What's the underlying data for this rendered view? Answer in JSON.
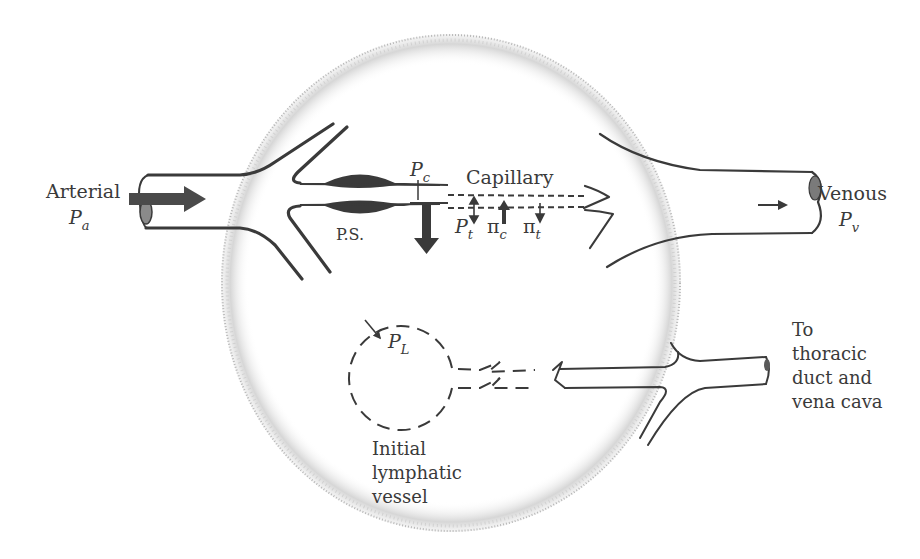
{
  "diagram": {
    "colors": {
      "ink": "#3a3a3a",
      "stipple": "#9a9a9a",
      "background": "#ffffff"
    },
    "labels": {
      "arterial": {
        "text": "Arterial",
        "symbol": "P",
        "subscript": "a"
      },
      "venous": {
        "text": "Venous",
        "symbol": "P",
        "subscript": "v"
      },
      "capillary": "Capillary",
      "precapillary_sphincter": "P.S.",
      "capillary_pressure": {
        "symbol": "P",
        "subscript": "c"
      },
      "tissue_pressure": {
        "symbol": "P",
        "subscript": "t"
      },
      "capillary_oncotic": {
        "symbol": "π",
        "subscript": "c"
      },
      "tissue_oncotic": {
        "symbol": "π",
        "subscript": "t"
      },
      "lymphatic_pressure": {
        "symbol": "P",
        "subscript": "L"
      },
      "initial_lymphatic": "Initial\nlymphatic\nvessel",
      "thoracic_duct": "To\nthoracic\nduct and\nvena cava"
    },
    "elements": [
      "arteriole-vessel",
      "precapillary-sphincter",
      "capillary",
      "venule-vessel",
      "tissue-space",
      "initial-lymphatic",
      "collecting-lymphatic"
    ]
  }
}
